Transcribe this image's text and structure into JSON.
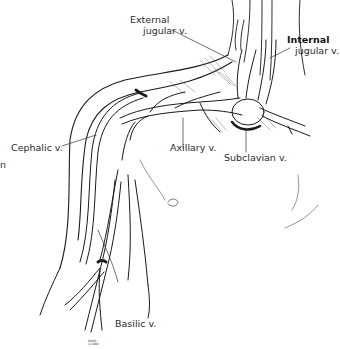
{
  "figure": {
    "labels": {
      "external_jugular_line1": "External",
      "external_jugular_line2": "jugular v.",
      "internal_jugular_line1": "Internal",
      "internal_jugular_line2": "jugular v.",
      "cephalic": "Cephalic v.",
      "axillary": "Axillary v.",
      "subclavian": "Subclavian v.",
      "basilic": "Basilic v.",
      "edge_fragment": "n"
    },
    "signature": [
      "MAYO",
      "©1990"
    ],
    "colors": {
      "background": "#ffffff",
      "ink": "#1a1a1a",
      "label_text": "#2a2a2a"
    }
  }
}
